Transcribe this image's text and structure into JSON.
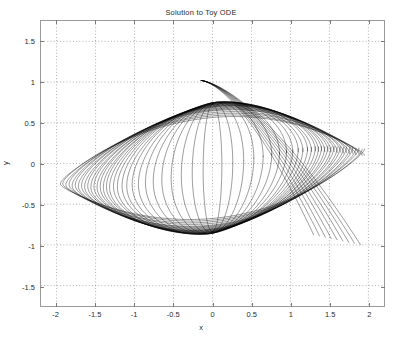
{
  "chart_data": {
    "type": "line",
    "title": "Solution to Toy ODE",
    "xlabel": "x",
    "ylabel": "y",
    "xlim": [
      -2.2,
      2.2
    ],
    "ylim": [
      -1.75,
      1.75
    ],
    "grid": true,
    "grid_style": "dotted",
    "legend": "none",
    "xticks": [
      -2,
      -1.5,
      -1,
      -0.5,
      0,
      0.5,
      1,
      1.5,
      2
    ],
    "xtick_labels": [
      "-2",
      "-1.5",
      "-1",
      "-0.5",
      "0",
      "0.5",
      "1",
      "1.5",
      "2"
    ],
    "yticks": [
      1.5,
      1,
      0.5,
      0,
      -0.5,
      -1,
      -1.5
    ],
    "ytick_labels": [
      "1.5",
      "1",
      "0.5",
      "0",
      "-0.5",
      "-1",
      "-1.5"
    ],
    "line_color": "#000000",
    "line_width": 0.4,
    "series_count": 30,
    "series": [
      {
        "name": "orbit-1",
        "a": 1.95,
        "b": 0.62,
        "skew": 0.3,
        "tilt": 0.1
      },
      {
        "name": "orbit-2",
        "a": 1.92,
        "b": 0.64,
        "skew": 0.31,
        "tilt": 0.1
      },
      {
        "name": "orbit-3",
        "a": 1.88,
        "b": 0.66,
        "skew": 0.32,
        "tilt": 0.11
      },
      {
        "name": "orbit-4",
        "a": 1.84,
        "b": 0.68,
        "skew": 0.33,
        "tilt": 0.11
      },
      {
        "name": "orbit-5",
        "a": 1.8,
        "b": 0.7,
        "skew": 0.34,
        "tilt": 0.12
      },
      {
        "name": "orbit-6",
        "a": 1.76,
        "b": 0.71,
        "skew": 0.35,
        "tilt": 0.12
      },
      {
        "name": "orbit-7",
        "a": 1.72,
        "b": 0.72,
        "skew": 0.36,
        "tilt": 0.13
      },
      {
        "name": "orbit-8",
        "a": 1.68,
        "b": 0.73,
        "skew": 0.37,
        "tilt": 0.13
      },
      {
        "name": "orbit-9",
        "a": 1.64,
        "b": 0.74,
        "skew": 0.38,
        "tilt": 0.14
      },
      {
        "name": "orbit-10",
        "a": 1.6,
        "b": 0.75,
        "skew": 0.39,
        "tilt": 0.14
      },
      {
        "name": "orbit-11",
        "a": 1.56,
        "b": 0.75,
        "skew": 0.4,
        "tilt": 0.15
      },
      {
        "name": "orbit-12",
        "a": 1.52,
        "b": 0.76,
        "skew": 0.41,
        "tilt": 0.15
      },
      {
        "name": "orbit-13",
        "a": 1.48,
        "b": 0.76,
        "skew": 0.42,
        "tilt": 0.16
      },
      {
        "name": "orbit-14",
        "a": 1.44,
        "b": 0.77,
        "skew": 0.43,
        "tilt": 0.16
      },
      {
        "name": "orbit-15",
        "a": 1.4,
        "b": 0.77,
        "skew": 0.44,
        "tilt": 0.17
      },
      {
        "name": "orbit-16",
        "a": 1.36,
        "b": 0.78,
        "skew": 0.45,
        "tilt": 0.17
      },
      {
        "name": "orbit-17",
        "a": 1.32,
        "b": 0.78,
        "skew": 0.46,
        "tilt": 0.18
      },
      {
        "name": "orbit-18",
        "a": 1.27,
        "b": 0.78,
        "skew": 0.47,
        "tilt": 0.18
      },
      {
        "name": "orbit-19",
        "a": 1.22,
        "b": 0.79,
        "skew": 0.48,
        "tilt": 0.19
      },
      {
        "name": "orbit-20",
        "a": 1.16,
        "b": 0.79,
        "skew": 0.49,
        "tilt": 0.19
      },
      {
        "name": "orbit-21",
        "a": 1.1,
        "b": 0.79,
        "skew": 0.5,
        "tilt": 0.2
      },
      {
        "name": "orbit-22",
        "a": 1.03,
        "b": 0.8,
        "skew": 0.51,
        "tilt": 0.2
      },
      {
        "name": "orbit-23",
        "a": 0.95,
        "b": 0.8,
        "skew": 0.52,
        "tilt": 0.21
      },
      {
        "name": "orbit-24",
        "a": 0.86,
        "b": 0.8,
        "skew": 0.53,
        "tilt": 0.21
      },
      {
        "name": "orbit-25",
        "a": 0.76,
        "b": 0.8,
        "skew": 0.54,
        "tilt": 0.22
      },
      {
        "name": "orbit-26",
        "a": 0.65,
        "b": 0.8,
        "skew": 0.55,
        "tilt": 0.22
      },
      {
        "name": "orbit-27",
        "a": 0.53,
        "b": 0.8,
        "skew": 0.56,
        "tilt": 0.23
      },
      {
        "name": "orbit-28",
        "a": 0.4,
        "b": 0.8,
        "skew": 0.57,
        "tilt": 0.23
      },
      {
        "name": "orbit-29",
        "a": 0.26,
        "b": 0.79,
        "skew": 0.58,
        "tilt": 0.24
      },
      {
        "name": "orbit-30",
        "a": 0.12,
        "b": 0.78,
        "skew": 0.59,
        "tilt": 0.24
      }
    ]
  }
}
